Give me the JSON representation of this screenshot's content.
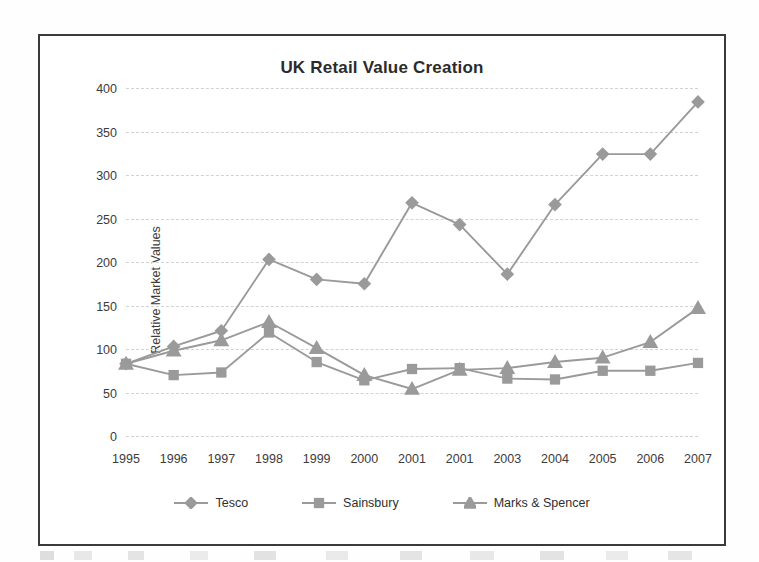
{
  "chart_data": {
    "type": "line",
    "title": "UK Retail Value Creation",
    "xlabel": "",
    "ylabel": "Relative Market Values",
    "categories": [
      "1995",
      "1996",
      "1997",
      "1998",
      "1999",
      "2000",
      "2001",
      "2001",
      "2003",
      "2004",
      "2005",
      "2006",
      "2007"
    ],
    "ylim": [
      0,
      400
    ],
    "yticks": [
      0,
      50,
      100,
      150,
      200,
      250,
      300,
      350,
      400
    ],
    "grid": true,
    "legend_position": "bottom",
    "series": [
      {
        "name": "Tesco",
        "marker": "diamond",
        "color": "#9a9a9a",
        "values": [
          83,
          103,
          121,
          203,
          180,
          175,
          268,
          243,
          186,
          266,
          324,
          324,
          384
        ]
      },
      {
        "name": "Sainsbury",
        "marker": "square",
        "color": "#9a9a9a",
        "values": [
          83,
          70,
          73,
          119,
          85,
          64,
          77,
          78,
          66,
          65,
          75,
          75,
          84
        ]
      },
      {
        "name": "Marks & Spencer",
        "marker": "triangle",
        "color": "#9a9a9a",
        "values": [
          83,
          98,
          110,
          131,
          101,
          70,
          54,
          76,
          78,
          85,
          90,
          108,
          147
        ]
      }
    ]
  },
  "legend": {
    "items": [
      {
        "label": "Tesco",
        "marker": "diamond"
      },
      {
        "label": "Sainsbury",
        "marker": "square"
      },
      {
        "label": "Marks & Spencer",
        "marker": "triangle"
      }
    ]
  },
  "colors": {
    "series": "#9a9a9a",
    "grid": "#d2d2d2",
    "frame": "#3a3a3a",
    "text": "#2b2b2b"
  }
}
